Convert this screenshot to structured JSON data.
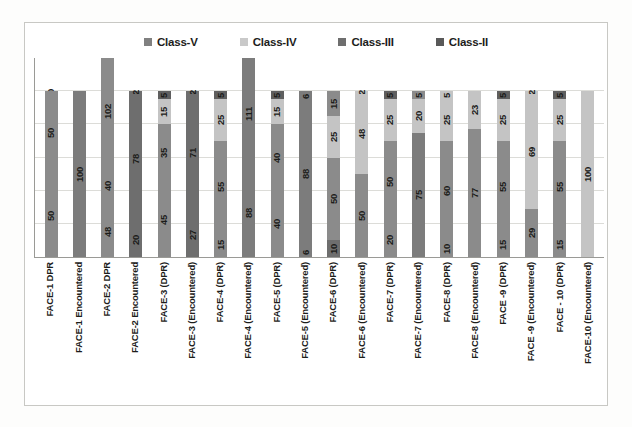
{
  "legend": {
    "position": "top-center",
    "items": [
      {
        "label": "Class-V",
        "color": "#808080"
      },
      {
        "label": "Class-IV",
        "color": "#c9c9c9"
      },
      {
        "label": "Class-III",
        "color": "#6e6e6e"
      },
      {
        "label": "Class-II",
        "color": "#595959"
      }
    ]
  },
  "chart_data": {
    "type": "bar",
    "stacked": true,
    "title": "",
    "xlabel": "",
    "ylabel": "",
    "ylim": [
      0,
      120
    ],
    "grid": true,
    "legend_position": "top-center",
    "categories": [
      "FACE-1 DPR",
      "FACE-1 Encountered",
      "FACE-2 DPR",
      "FACE-2 Encountered",
      "FACE-3 (DPR)",
      "FACE-3 (Encountered)",
      "FACE-4 (DPR)",
      "FACE-4 (Encountered)",
      "FACE-5 (DPR)",
      "FACE-5 (Encountered)",
      "FACE-6 (DPR)",
      "FACE-6 (Encountered)",
      "FACE-7 (DPR)",
      "FACE-7 (Encountered)",
      "FACE-8 (DPR)",
      "FACE-8 (Encountered)",
      "FACE -9 (DPR)",
      "FACE -9 (Encountered)",
      "FACE - 10 (DPR)",
      "FACE-10 (Encountered)"
    ],
    "series": [
      {
        "name": "Class-V",
        "color": "#808080",
        "values": [
          50,
          0,
          48,
          20,
          45,
          27,
          15,
          0,
          40,
          6,
          10,
          50,
          20,
          0,
          10,
          0,
          15,
          29,
          15,
          0
        ]
      },
      {
        "name": "Class-III",
        "color": "#6e6e6e",
        "values": [
          0,
          100,
          40,
          78,
          35,
          71,
          55,
          88,
          40,
          88,
          50,
          0,
          50,
          75,
          60,
          77,
          55,
          0,
          55,
          0
        ]
      },
      {
        "name": "Class-IV",
        "color": "#c9c9c9",
        "values": [
          50,
          0,
          102,
          0,
          15,
          0,
          25,
          0,
          15,
          0,
          25,
          48,
          25,
          20,
          25,
          23,
          25,
          69,
          25,
          100
        ]
      },
      {
        "name": "Class-II",
        "color": "#595959",
        "values": [
          0,
          0,
          0,
          2,
          5,
          2,
          5,
          111,
          5,
          6,
          15,
          2,
          5,
          5,
          5,
          0,
          5,
          2,
          5,
          0
        ]
      }
    ],
    "bars": [
      {
        "category": "FACE-1 DPR",
        "segments": [
          {
            "label": "0",
            "value": 0,
            "class": "Class-II",
            "color": "#595959"
          },
          {
            "label": "50",
            "value": 50,
            "class": "Class-IV",
            "color": "#8b8b8b"
          },
          {
            "label": "50",
            "value": 50,
            "class": "Class-V",
            "color": "#8b8b8b"
          }
        ]
      },
      {
        "category": "FACE-1 Encountered",
        "segments": [
          {
            "label": "100",
            "value": 100,
            "class": "Class-III",
            "color": "#7c7c7c"
          }
        ]
      },
      {
        "category": "FACE-2 DPR",
        "segments": [
          {
            "label": "102",
            "value": 102,
            "class": "Class-IV",
            "color": "#8b8b8b"
          },
          {
            "label": "40",
            "value": 40,
            "class": "Class-III",
            "color": "#8b8b8b"
          },
          {
            "label": "48",
            "value": 48,
            "class": "Class-V",
            "color": "#8b8b8b"
          }
        ]
      },
      {
        "category": "FACE-2 Encountered",
        "segments": [
          {
            "label": "2",
            "value": 2,
            "class": "Class-II",
            "color": "#6e6e6e"
          },
          {
            "label": "78",
            "value": 78,
            "class": "Class-III",
            "color": "#6e6e6e"
          },
          {
            "label": "20",
            "value": 20,
            "class": "Class-V",
            "color": "#6e6e6e"
          }
        ]
      },
      {
        "category": "FACE-3 (DPR)",
        "segments": [
          {
            "label": "5",
            "value": 5,
            "class": "Class-II",
            "color": "#5f5f5f"
          },
          {
            "label": "15",
            "value": 15,
            "class": "Class-IV",
            "color": "#c4c4c4"
          },
          {
            "label": "35",
            "value": 35,
            "class": "Class-III",
            "color": "#8b8b8b"
          },
          {
            "label": "45",
            "value": 45,
            "class": "Class-V",
            "color": "#8b8b8b"
          }
        ]
      },
      {
        "category": "FACE-3 (Encountered)",
        "segments": [
          {
            "label": "2",
            "value": 2,
            "class": "Class-II",
            "color": "#6e6e6e"
          },
          {
            "label": "71",
            "value": 71,
            "class": "Class-III",
            "color": "#6e6e6e"
          },
          {
            "label": "27",
            "value": 27,
            "class": "Class-V",
            "color": "#6e6e6e"
          }
        ]
      },
      {
        "category": "FACE-4 (DPR)",
        "segments": [
          {
            "label": "5",
            "value": 5,
            "class": "Class-II",
            "color": "#5f5f5f"
          },
          {
            "label": "25",
            "value": 25,
            "class": "Class-IV",
            "color": "#c4c4c4"
          },
          {
            "label": "55",
            "value": 55,
            "class": "Class-III",
            "color": "#8b8b8b"
          },
          {
            "label": "15",
            "value": 15,
            "class": "Class-V",
            "color": "#8b8b8b"
          }
        ]
      },
      {
        "category": "FACE-4 (Encountered)",
        "segments": [
          {
            "label": "111",
            "value": 111,
            "class": "Class-II",
            "color": "#7c7c7c"
          },
          {
            "label": "88",
            "value": 88,
            "class": "Class-III",
            "color": "#7c7c7c"
          }
        ]
      },
      {
        "category": "FACE-5 (DPR)",
        "segments": [
          {
            "label": "5",
            "value": 5,
            "class": "Class-II",
            "color": "#5f5f5f"
          },
          {
            "label": "15",
            "value": 15,
            "class": "Class-IV",
            "color": "#c4c4c4"
          },
          {
            "label": "40",
            "value": 40,
            "class": "Class-III",
            "color": "#8b8b8b"
          },
          {
            "label": "40",
            "value": 40,
            "class": "Class-V",
            "color": "#8b8b8b"
          }
        ]
      },
      {
        "category": "FACE-5 (Encountered)",
        "segments": [
          {
            "label": "6",
            "value": 6,
            "class": "Class-II",
            "color": "#7c7c7c"
          },
          {
            "label": "88",
            "value": 88,
            "class": "Class-III",
            "color": "#7c7c7c"
          },
          {
            "label": "6",
            "value": 6,
            "class": "Class-V",
            "color": "#7c7c7c"
          }
        ]
      },
      {
        "category": "FACE-6 (DPR)",
        "segments": [
          {
            "label": "15",
            "value": 15,
            "class": "Class-II",
            "color": "#8b8b8b"
          },
          {
            "label": "25",
            "value": 25,
            "class": "Class-IV",
            "color": "#c4c4c4"
          },
          {
            "label": "50",
            "value": 50,
            "class": "Class-III",
            "color": "#8b8b8b"
          },
          {
            "label": "10",
            "value": 10,
            "class": "Class-V",
            "color": "#6e6e6e"
          }
        ]
      },
      {
        "category": "FACE-6 (Encountered)",
        "segments": [
          {
            "label": "2",
            "value": 2,
            "class": "Class-II",
            "color": "#c4c4c4"
          },
          {
            "label": "48",
            "value": 48,
            "class": "Class-IV",
            "color": "#c4c4c4"
          },
          {
            "label": "50",
            "value": 50,
            "class": "Class-III",
            "color": "#8b8b8b"
          }
        ]
      },
      {
        "category": "FACE-7 (DPR)",
        "segments": [
          {
            "label": "5",
            "value": 5,
            "class": "Class-II",
            "color": "#5f5f5f"
          },
          {
            "label": "25",
            "value": 25,
            "class": "Class-IV",
            "color": "#c4c4c4"
          },
          {
            "label": "50",
            "value": 50,
            "class": "Class-III",
            "color": "#8b8b8b"
          },
          {
            "label": "20",
            "value": 20,
            "class": "Class-V",
            "color": "#8b8b8b"
          }
        ]
      },
      {
        "category": "FACE-7 (Encountered)",
        "segments": [
          {
            "label": "5",
            "value": 5,
            "class": "Class-II",
            "color": "#8b8b8b"
          },
          {
            "label": "20",
            "value": 20,
            "class": "Class-IV",
            "color": "#c4c4c4"
          },
          {
            "label": "75",
            "value": 75,
            "class": "Class-III",
            "color": "#7c7c7c"
          }
        ]
      },
      {
        "category": "FACE-8 (DPR)",
        "segments": [
          {
            "label": "5",
            "value": 5,
            "class": "Class-II",
            "color": "#c4c4c4"
          },
          {
            "label": "25",
            "value": 25,
            "class": "Class-IV",
            "color": "#c4c4c4"
          },
          {
            "label": "60",
            "value": 60,
            "class": "Class-III",
            "color": "#8b8b8b"
          },
          {
            "label": "10",
            "value": 10,
            "class": "Class-V",
            "color": "#8b8b8b"
          }
        ]
      },
      {
        "category": "FACE-8 (Encountered)",
        "segments": [
          {
            "label": "23",
            "value": 23,
            "class": "Class-IV",
            "color": "#c4c4c4"
          },
          {
            "label": "77",
            "value": 77,
            "class": "Class-III",
            "color": "#8b8b8b"
          }
        ]
      },
      {
        "category": "FACE -9 (DPR)",
        "segments": [
          {
            "label": "5",
            "value": 5,
            "class": "Class-II",
            "color": "#5f5f5f"
          },
          {
            "label": "25",
            "value": 25,
            "class": "Class-IV",
            "color": "#c4c4c4"
          },
          {
            "label": "55",
            "value": 55,
            "class": "Class-III",
            "color": "#8b8b8b"
          },
          {
            "label": "15",
            "value": 15,
            "class": "Class-V",
            "color": "#8b8b8b"
          }
        ]
      },
      {
        "category": "FACE -9 (Encountered)",
        "segments": [
          {
            "label": "2",
            "value": 2,
            "class": "Class-II",
            "color": "#c4c4c4"
          },
          {
            "label": "69",
            "value": 69,
            "class": "Class-IV",
            "color": "#c4c4c4"
          },
          {
            "label": "29",
            "value": 29,
            "class": "Class-V",
            "color": "#8b8b8b"
          }
        ]
      },
      {
        "category": "FACE - 10 (DPR)",
        "segments": [
          {
            "label": "5",
            "value": 5,
            "class": "Class-II",
            "color": "#5f5f5f"
          },
          {
            "label": "25",
            "value": 25,
            "class": "Class-IV",
            "color": "#c4c4c4"
          },
          {
            "label": "55",
            "value": 55,
            "class": "Class-III",
            "color": "#8b8b8b"
          },
          {
            "label": "15",
            "value": 15,
            "class": "Class-V",
            "color": "#8b8b8b"
          }
        ]
      },
      {
        "category": "FACE-10 (Encountered)",
        "segments": [
          {
            "label": "100",
            "value": 100,
            "class": "Class-IV",
            "color": "#c4c4c4"
          }
        ]
      }
    ]
  }
}
